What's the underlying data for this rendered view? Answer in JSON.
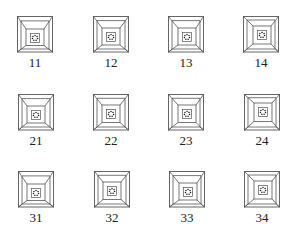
{
  "figure": {
    "line_color": "#555555",
    "dot_color": "#1a1a1a",
    "rows": [
      {
        "cells": [
          {
            "label": "11",
            "x": 17,
            "y": 16,
            "inner_dx": 0,
            "inner_dy": 3
          },
          {
            "label": "12",
            "x": 93,
            "y": 16,
            "inner_dx": 0,
            "inner_dy": 2
          },
          {
            "label": "13",
            "x": 168,
            "y": 16,
            "inner_dx": 1,
            "inner_dy": 2
          },
          {
            "label": "14",
            "x": 243,
            "y": 16,
            "inner_dx": 1,
            "inner_dy": 0
          }
        ]
      },
      {
        "cells": [
          {
            "label": "21",
            "x": 18,
            "y": 94,
            "inner_dx": 0,
            "inner_dy": 2
          },
          {
            "label": "22",
            "x": 93,
            "y": 94,
            "inner_dx": 0,
            "inner_dy": 1
          },
          {
            "label": "23",
            "x": 168,
            "y": 94,
            "inner_dx": 1,
            "inner_dy": 1
          },
          {
            "label": "24",
            "x": 244,
            "y": 94,
            "inner_dx": 1,
            "inner_dy": -1
          }
        ]
      },
      {
        "cells": [
          {
            "label": "31",
            "x": 18,
            "y": 171,
            "inner_dx": 0,
            "inner_dy": 3
          },
          {
            "label": "32",
            "x": 94,
            "y": 171,
            "inner_dx": 0,
            "inner_dy": 1
          },
          {
            "label": "33",
            "x": 169,
            "y": 171,
            "inner_dx": 1,
            "inner_dy": 2
          },
          {
            "label": "34",
            "x": 244,
            "y": 171,
            "inner_dx": 1,
            "inner_dy": 0
          }
        ]
      }
    ]
  },
  "labels": [
    "11",
    "12",
    "13",
    "14",
    "21",
    "22",
    "23",
    "24",
    "31",
    "32",
    "33",
    "34"
  ]
}
